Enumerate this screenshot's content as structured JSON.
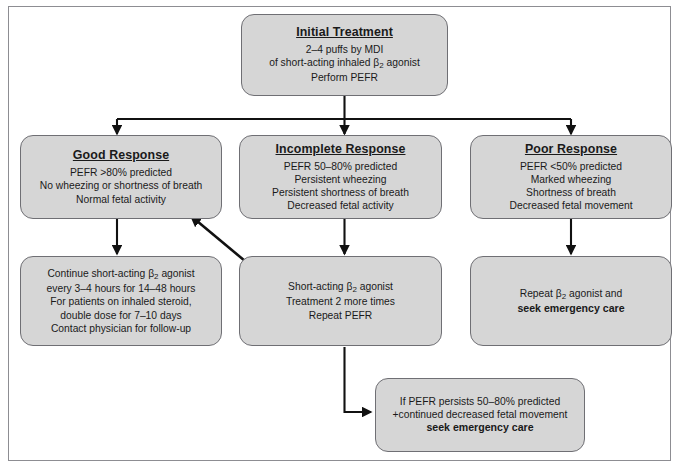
{
  "diagram": {
    "title_hidden": "Asthma exacerbation management in pregnancy",
    "colors": {
      "node_fill": "#d6d6d6",
      "node_border": "#6f6f74",
      "connector": "#111111",
      "frame_border": "#8d8d92",
      "page_background": "#ffffff"
    },
    "nodes": [
      {
        "id": "initial-treatment",
        "title": "Initial Treatment",
        "lines": [
          "2–4 puffs by MDI",
          "of short-acting inhaled β₂ agonist",
          "Perform PEFR"
        ]
      },
      {
        "id": "good-response",
        "title": "Good Response",
        "lines": [
          "PEFR >80% predicted",
          "No wheezing or shortness of breath",
          "Normal fetal activity"
        ]
      },
      {
        "id": "incomplete-response",
        "title": "Incomplete Response",
        "lines": [
          "PEFR 50–80% predicted",
          "Persistent wheezing",
          "Persistent shortness of breath",
          "Decreased fetal activity"
        ]
      },
      {
        "id": "poor-response",
        "title": "Poor Response",
        "lines": [
          "PEFR <50% predicted",
          "Marked wheezing",
          "Shortness of breath",
          "Decreased fetal movement"
        ]
      },
      {
        "id": "continue-treatment",
        "title": "",
        "lines": [
          "Continue short-acting β₂ agonist",
          "every 3–4 hours for 14–48 hours",
          "For patients on inhaled steroid,",
          "double dose for 7–10 days",
          "Contact physician for follow-up"
        ]
      },
      {
        "id": "repeat-treatment",
        "title": "",
        "lines": [
          "Short-acting β₂ agonist",
          "Treatment 2 more times",
          "Repeat PEFR"
        ]
      },
      {
        "id": "emergency-care",
        "title": "",
        "lines": [
          "Repeat β₂ agonist and",
          "seek emergency care"
        ],
        "bold_lines": [
          1
        ]
      },
      {
        "id": "persistent-emergency",
        "title": "",
        "lines": [
          "If PEFR persists 50–80% predicted",
          "+continued decreased fetal movement",
          "seek emergency care"
        ],
        "bold_lines": [
          2
        ]
      }
    ],
    "connectors": [
      {
        "from": "initial-treatment",
        "to": "good-response",
        "type": "split-branch"
      },
      {
        "from": "initial-treatment",
        "to": "incomplete-response",
        "type": "split-branch"
      },
      {
        "from": "initial-treatment",
        "to": "poor-response",
        "type": "split-branch"
      },
      {
        "from": "good-response",
        "to": "continue-treatment",
        "type": "straight-down"
      },
      {
        "from": "incomplete-response",
        "to": "repeat-treatment",
        "type": "straight-down"
      },
      {
        "from": "poor-response",
        "to": "emergency-care",
        "type": "straight-down"
      },
      {
        "from": "repeat-treatment",
        "to": "good-response",
        "type": "diagonal-up-left"
      },
      {
        "from": "repeat-treatment",
        "to": "persistent-emergency",
        "type": "down-then-right"
      }
    ]
  }
}
